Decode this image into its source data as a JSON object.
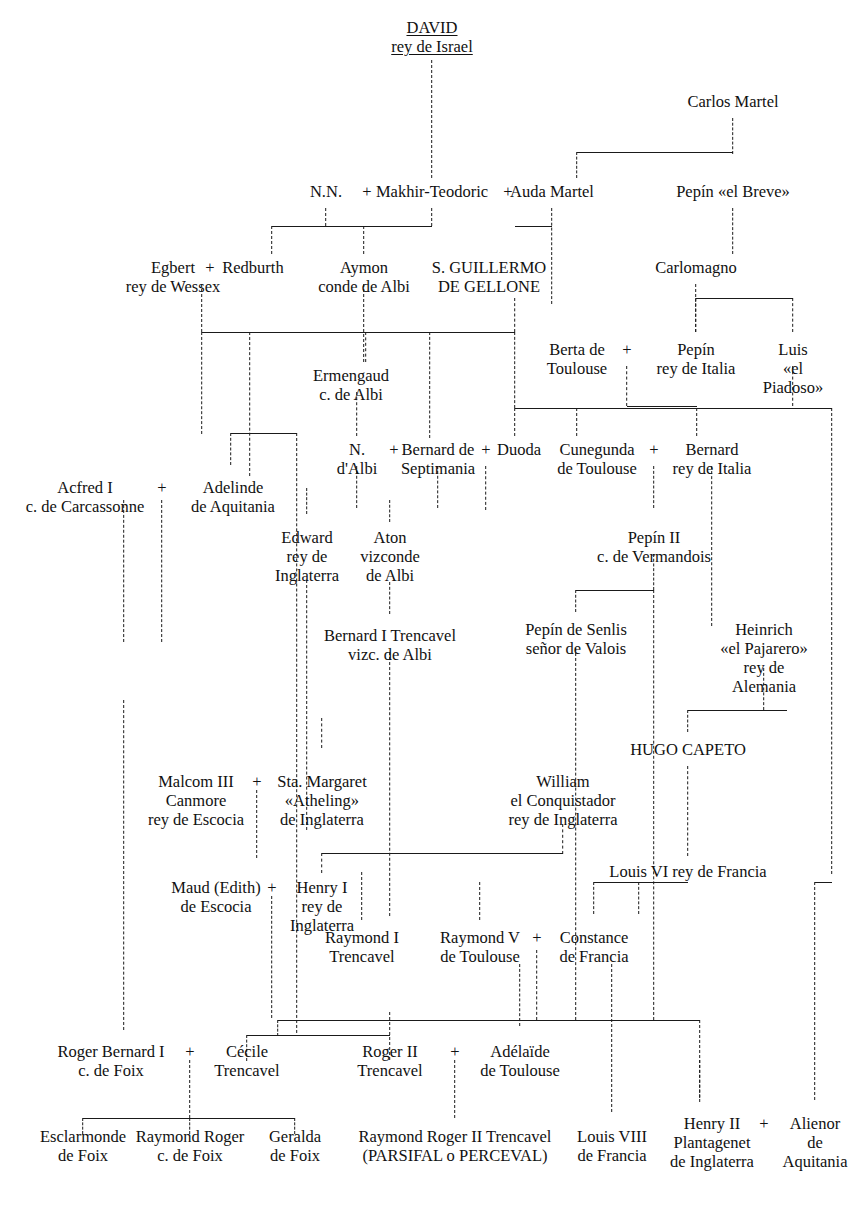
{
  "colors": {
    "ink": "#111111",
    "line": "#1a1a1a",
    "background": "#ffffff"
  },
  "plus_symbol": "+",
  "nodes": [
    {
      "id": "david",
      "text": "DAVID\nrey de Israel",
      "x": 432,
      "y": 18,
      "root": true
    },
    {
      "id": "carlos_martel",
      "text": "Carlos Martel",
      "x": 733,
      "y": 92
    },
    {
      "id": "nn",
      "text": "N.N.",
      "x": 326,
      "y": 182
    },
    {
      "id": "makhir",
      "text": "Makhir-Teodoric",
      "x": 432,
      "y": 182
    },
    {
      "id": "auda",
      "text": "Auda Martel",
      "x": 552,
      "y": 182
    },
    {
      "id": "pepin_breve",
      "text": "Pepín «el Breve»",
      "x": 733,
      "y": 182
    },
    {
      "id": "egbert",
      "text": "Egbert\nrey de Wessex",
      "x": 173,
      "y": 258
    },
    {
      "id": "redburth",
      "text": "Redburth",
      "x": 253,
      "y": 258
    },
    {
      "id": "aymon",
      "text": "Aymon\nconde de Albi",
      "x": 364,
      "y": 258
    },
    {
      "id": "guillermo",
      "text": "S. GUILLERMO\nDE GELLONE",
      "x": 489,
      "y": 258
    },
    {
      "id": "carlomagno",
      "text": "Carlomagno",
      "x": 696,
      "y": 258
    },
    {
      "id": "berta",
      "text": "Berta de\nToulouse",
      "x": 577,
      "y": 340
    },
    {
      "id": "pepin_italia",
      "text": "Pepín\nrey de Italia",
      "x": 696,
      "y": 340
    },
    {
      "id": "luis_piadoso",
      "text": "Luis\n«el Piadoso»",
      "x": 793,
      "y": 340
    },
    {
      "id": "ermengaud",
      "text": "Ermengaud\nc. de Albi",
      "x": 351,
      "y": 366
    },
    {
      "id": "n_albi",
      "text": "N.\nd'Albi",
      "x": 357,
      "y": 440
    },
    {
      "id": "bernard_sept",
      "text": "Bernard de\nSeptimania",
      "x": 438,
      "y": 440
    },
    {
      "id": "duoda",
      "text": "Duoda",
      "x": 519,
      "y": 440
    },
    {
      "id": "cunegunda",
      "text": "Cunegunda\nde Toulouse",
      "x": 597,
      "y": 440
    },
    {
      "id": "bernard_ita",
      "text": "Bernard\nrey de Italia",
      "x": 712,
      "y": 440
    },
    {
      "id": "acfred",
      "text": "Acfred I\nc. de Carcassonne",
      "x": 85,
      "y": 478
    },
    {
      "id": "adelinde",
      "text": "Adelinde\nde Aquitania",
      "x": 233,
      "y": 478
    },
    {
      "id": "edward",
      "text": "Edward\nrey de\nInglaterra",
      "x": 307,
      "y": 528
    },
    {
      "id": "aton",
      "text": "Aton\nvizconde\nde Albi",
      "x": 390,
      "y": 528
    },
    {
      "id": "pepin_ii",
      "text": "Pepín II\nc. de Vermandois",
      "x": 654,
      "y": 528
    },
    {
      "id": "bernard_tren",
      "text": "Bernard I Trencavel\nvizc. de Albi",
      "x": 390,
      "y": 626
    },
    {
      "id": "pepin_senlis",
      "text": "Pepín de Senlis\nseñor de Valois",
      "x": 576,
      "y": 620
    },
    {
      "id": "heinrich",
      "text": "Heinrich\n«el Pajarero»\nrey de Alemania",
      "x": 764,
      "y": 620
    },
    {
      "id": "hugo_capeto",
      "text": "HUGO CAPETO",
      "x": 688,
      "y": 740
    },
    {
      "id": "malcolm",
      "text": "Malcom III\nCanmore\nrey de Escocia",
      "x": 196,
      "y": 772
    },
    {
      "id": "margaret",
      "text": "Sta. Margaret\n«Atheling»\nde Inglaterra",
      "x": 322,
      "y": 772
    },
    {
      "id": "william",
      "text": "William\nel Conquistador\nrey de Inglaterra",
      "x": 563,
      "y": 772
    },
    {
      "id": "maud",
      "text": "Maud (Edith)\nde Escocia",
      "x": 216,
      "y": 878
    },
    {
      "id": "henry_i",
      "text": "Henry I\nrey de\nInglaterra",
      "x": 322,
      "y": 878
    },
    {
      "id": "louis_vi",
      "text": "Louis VI rey de Francia",
      "x": 688,
      "y": 862
    },
    {
      "id": "raymond_i",
      "text": "Raymond I\nTrencavel",
      "x": 362,
      "y": 928
    },
    {
      "id": "raymond_v",
      "text": "Raymond V\nde Toulouse",
      "x": 480,
      "y": 928
    },
    {
      "id": "constance",
      "text": "Constance\nde Francia",
      "x": 594,
      "y": 928
    },
    {
      "id": "roger_bern",
      "text": "Roger Bernard I\nc. de Foix",
      "x": 111,
      "y": 1042
    },
    {
      "id": "cecile",
      "text": "Cécile\nTrencavel",
      "x": 247,
      "y": 1042
    },
    {
      "id": "roger_ii",
      "text": "Roger II\nTrencavel",
      "x": 390,
      "y": 1042
    },
    {
      "id": "adelaide",
      "text": "Adélaïde\nde Toulouse",
      "x": 520,
      "y": 1042
    },
    {
      "id": "louis_viii",
      "text": "Louis VIII\nde Francia",
      "x": 612,
      "y": 1127
    },
    {
      "id": "henry_ii",
      "text": "Henry II\nPlantagenet\nde Inglaterra",
      "x": 712,
      "y": 1114
    },
    {
      "id": "alienor",
      "text": "Alienor\nde\nAquitania",
      "x": 815,
      "y": 1114
    },
    {
      "id": "esclarmonde",
      "text": "Esclarmonde\nde Foix",
      "x": 83,
      "y": 1127
    },
    {
      "id": "raymond_rog",
      "text": "Raymond Roger\nc. de Foix",
      "x": 190,
      "y": 1127
    },
    {
      "id": "geralda",
      "text": "Geralda\nde Foix",
      "x": 295,
      "y": 1127
    },
    {
      "id": "parsifal",
      "text": "Raymond Roger II Trencavel\n(PARSIFAL o PERCEVAL)",
      "x": 455,
      "y": 1127
    }
  ],
  "plus_signs": [
    {
      "id": "p-nn-makhir",
      "x": 367,
      "y": 182
    },
    {
      "id": "p-makhir-auda",
      "x": 508,
      "y": 182
    },
    {
      "id": "p-egbert-redburth",
      "x": 210,
      "y": 258
    },
    {
      "id": "p-berta-pepin",
      "x": 627,
      "y": 340
    },
    {
      "id": "p-nalbi-bernard",
      "x": 394,
      "y": 440
    },
    {
      "id": "p-bernard-duoda",
      "x": 486,
      "y": 440
    },
    {
      "id": "p-cune-bernardita",
      "x": 654,
      "y": 440
    },
    {
      "id": "p-acfred-adelinde",
      "x": 162,
      "y": 478
    },
    {
      "id": "p-malcolm-marg",
      "x": 257,
      "y": 772
    },
    {
      "id": "p-maud-henry",
      "x": 272,
      "y": 878
    },
    {
      "id": "p-raymondv-const",
      "x": 537,
      "y": 928
    },
    {
      "id": "p-rogerb-cecile",
      "x": 190,
      "y": 1042
    },
    {
      "id": "p-rogerii-adel",
      "x": 455,
      "y": 1042
    },
    {
      "id": "p-henryii-alienor",
      "x": 764,
      "y": 1114
    }
  ],
  "vlines": [
    {
      "id": "v-david",
      "x": 432,
      "y": 60,
      "h": 118
    },
    {
      "id": "v-carlos",
      "x": 733,
      "y": 118,
      "h": 36
    },
    {
      "id": "v-carlos-left",
      "x": 577,
      "y": 152,
      "h": 26
    },
    {
      "id": "v-pepinbreve",
      "x": 733,
      "y": 208,
      "h": 46
    },
    {
      "id": "v-nn-down",
      "x": 326,
      "y": 208,
      "h": 18
    },
    {
      "id": "v-makhir-down",
      "x": 432,
      "y": 208,
      "h": 18
    },
    {
      "id": "v-auda-down",
      "x": 552,
      "y": 208,
      "h": 96
    },
    {
      "id": "v-redburth-up",
      "x": 272,
      "y": 226,
      "h": 28
    },
    {
      "id": "v-aymon-up",
      "x": 364,
      "y": 226,
      "h": 28
    },
    {
      "id": "v-carlomagno",
      "x": 696,
      "y": 284,
      "h": 48
    },
    {
      "id": "v-redburth-down",
      "x": 202,
      "y": 284,
      "h": 48
    },
    {
      "id": "v-guillermo-down",
      "x": 515,
      "y": 298,
      "h": 34
    },
    {
      "id": "v-aymon-down",
      "x": 364,
      "y": 284,
      "h": 78
    },
    {
      "id": "v-pepin-ita-up",
      "x": 696,
      "y": 298,
      "h": 34
    },
    {
      "id": "v-luis-up",
      "x": 793,
      "y": 298,
      "h": 34
    },
    {
      "id": "v-bar1-a",
      "x": 202,
      "y": 332,
      "h": 102
    },
    {
      "id": "v-bar1-b",
      "x": 250,
      "y": 332,
      "h": 144
    },
    {
      "id": "v-bar1-c",
      "x": 366,
      "y": 332,
      "h": 30
    },
    {
      "id": "v-bar1-d",
      "x": 430,
      "y": 332,
      "h": 106
    },
    {
      "id": "v-bar1-e",
      "x": 515,
      "y": 332,
      "h": 76
    },
    {
      "id": "v-ermengaud-down",
      "x": 357,
      "y": 392,
      "h": 44
    },
    {
      "id": "v-berta-down",
      "x": 627,
      "y": 366,
      "h": 40
    },
    {
      "id": "v-luis-down",
      "x": 793,
      "y": 366,
      "h": 40
    },
    {
      "id": "v-bar2-a",
      "x": 515,
      "y": 408,
      "h": 28
    },
    {
      "id": "v-bar2-b",
      "x": 577,
      "y": 408,
      "h": 28
    },
    {
      "id": "v-bar2-c",
      "x": 697,
      "y": 408,
      "h": 28
    },
    {
      "id": "v-bar2-d",
      "x": 832,
      "y": 408,
      "h": 466
    },
    {
      "id": "v-adelinde-down",
      "x": 231,
      "y": 433,
      "h": 32
    },
    {
      "id": "v-cecil-left",
      "x": 297,
      "y": 433,
      "h": 600
    },
    {
      "id": "v-nalbi-down",
      "x": 357,
      "y": 466,
      "h": 42
    },
    {
      "id": "v-bernard-down",
      "x": 438,
      "y": 466,
      "h": 42
    },
    {
      "id": "v-duoda-mid",
      "x": 486,
      "y": 466,
      "h": 44
    },
    {
      "id": "v-cune-down",
      "x": 654,
      "y": 466,
      "h": 42
    },
    {
      "id": "v-bernardita-down",
      "x": 712,
      "y": 466,
      "h": 160
    },
    {
      "id": "v-acfred-mid",
      "x": 162,
      "y": 500,
      "h": 142
    },
    {
      "id": "v-edward-down",
      "x": 307,
      "y": 488,
      "h": 26
    },
    {
      "id": "v-aton-down",
      "x": 390,
      "y": 582,
      "h": 32
    },
    {
      "id": "v-aton-up",
      "x": 390,
      "y": 500,
      "h": 22
    },
    {
      "id": "v-edward-long",
      "x": 307,
      "y": 580,
      "h": 250
    },
    {
      "id": "v-pepinii-down",
      "x": 654,
      "y": 554,
      "h": 36
    },
    {
      "id": "v-pepinsenlis-up",
      "x": 576,
      "y": 590,
      "h": 22
    },
    {
      "id": "v-pepinsenlis-down",
      "x": 576,
      "y": 648,
      "h": 372
    },
    {
      "id": "v-vermandois-down",
      "x": 654,
      "y": 590,
      "h": 430
    },
    {
      "id": "v-heinrich-down",
      "x": 764,
      "y": 668,
      "h": 42
    },
    {
      "id": "v-bernardtren-down",
      "x": 390,
      "y": 652,
      "h": 264
    },
    {
      "id": "v-hugo-up",
      "x": 688,
      "y": 710,
      "h": 22
    },
    {
      "id": "v-hugo-down",
      "x": 688,
      "y": 766,
      "h": 90
    },
    {
      "id": "v-roger1-down",
      "x": 124,
      "y": 700,
      "h": 330
    },
    {
      "id": "v-roger1-up",
      "x": 124,
      "y": 500,
      "h": 142
    },
    {
      "id": "v-margaret-up",
      "x": 322,
      "y": 718,
      "h": 30
    },
    {
      "id": "v-malcolm-mid",
      "x": 257,
      "y": 790,
      "h": 68
    },
    {
      "id": "v-william-down",
      "x": 563,
      "y": 824,
      "h": 30
    },
    {
      "id": "v-bar3-a",
      "x": 322,
      "y": 853,
      "h": 20
    },
    {
      "id": "v-henryi-down",
      "x": 272,
      "y": 896,
      "h": 122
    },
    {
      "id": "v-louisvi-down",
      "x": 594,
      "y": 882,
      "h": 32
    },
    {
      "id": "v-const-down",
      "x": 639,
      "y": 882,
      "h": 32
    },
    {
      "id": "v-raymondv-up",
      "x": 480,
      "y": 882,
      "h": 38
    },
    {
      "id": "v-raymondi-up",
      "x": 362,
      "y": 872,
      "h": 48
    },
    {
      "id": "v-const-mid",
      "x": 537,
      "y": 950,
      "h": 70
    },
    {
      "id": "v-bar4-a",
      "x": 278,
      "y": 1020,
      "h": 16
    },
    {
      "id": "v-bar4-b",
      "x": 700,
      "y": 1020,
      "h": 78
    },
    {
      "id": "v-cecile-up",
      "x": 247,
      "y": 1035,
      "h": 26
    },
    {
      "id": "v-rogerii-up",
      "x": 390,
      "y": 1012,
      "h": 48
    },
    {
      "id": "v-rogerb-mid",
      "x": 190,
      "y": 1060,
      "h": 58
    },
    {
      "id": "v-parsifal-down",
      "x": 455,
      "y": 1060,
      "h": 58
    },
    {
      "id": "v-adelaide-up",
      "x": 520,
      "y": 964,
      "h": 62
    },
    {
      "id": "v-louisviii-down",
      "x": 612,
      "y": 964,
      "h": 148
    },
    {
      "id": "v-henryii-down",
      "x": 700,
      "y": 1060,
      "h": 42
    },
    {
      "id": "v-alienor-down",
      "x": 815,
      "y": 882,
      "h": 218
    },
    {
      "id": "v-esclar-down",
      "x": 83,
      "y": 1118,
      "h": 16
    },
    {
      "id": "v-rayrog-down",
      "x": 190,
      "y": 1118,
      "h": 16
    },
    {
      "id": "v-geralda-down",
      "x": 295,
      "y": 1118,
      "h": 16
    }
  ],
  "hlines": [
    {
      "id": "h-carlos",
      "x": 577,
      "y": 152,
      "w": 156
    },
    {
      "id": "h-nn-child",
      "x": 272,
      "y": 226,
      "w": 160
    },
    {
      "id": "h-auda",
      "x": 515,
      "y": 226,
      "w": 37
    },
    {
      "id": "h-carloma",
      "x": 696,
      "y": 298,
      "w": 97
    },
    {
      "id": "h-sibling1",
      "x": 202,
      "y": 332,
      "w": 313
    },
    {
      "id": "h-berta",
      "x": 627,
      "y": 406,
      "w": 70
    },
    {
      "id": "h-sibling2",
      "x": 515,
      "y": 408,
      "w": 317
    },
    {
      "id": "h-adelinde",
      "x": 231,
      "y": 433,
      "w": 66
    },
    {
      "id": "h-pepinii",
      "x": 576,
      "y": 590,
      "w": 78
    },
    {
      "id": "h-heinrich",
      "x": 688,
      "y": 710,
      "w": 99
    },
    {
      "id": "h-william",
      "x": 322,
      "y": 853,
      "w": 241
    },
    {
      "id": "h-louisvi",
      "x": 594,
      "y": 882,
      "w": 94
    },
    {
      "id": "h-alienor",
      "x": 815,
      "y": 882,
      "w": 17
    },
    {
      "id": "h-bottom1",
      "x": 278,
      "y": 1020,
      "w": 422
    },
    {
      "id": "h-cecile",
      "x": 247,
      "y": 1035,
      "w": 143
    },
    {
      "id": "h-foix",
      "x": 83,
      "y": 1118,
      "w": 212
    }
  ]
}
